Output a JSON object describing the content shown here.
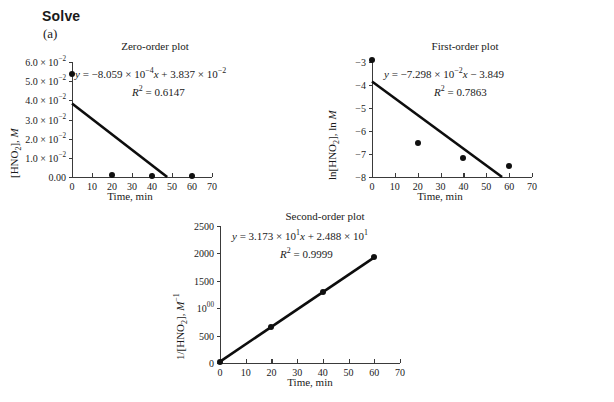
{
  "heading": "Solve",
  "part_label": "(a)",
  "chart_data": [
    {
      "id": "zero-order",
      "type": "scatter",
      "title": "Zero-order plot",
      "xlabel": "Time, min",
      "ylabel": "[HNO2], M",
      "equation": "y = −8.059 × 10−4x + 3.837 × 10−2",
      "r2_label": "R2 = 0.6147",
      "r2_value": 0.6147,
      "slope": -0.0008059,
      "intercept": 0.03837,
      "xlim": [
        0,
        70
      ],
      "ylim": [
        0,
        0.06
      ],
      "xticks": [
        0,
        10,
        20,
        30,
        40,
        50,
        60,
        70
      ],
      "yticks": [
        0,
        0.01,
        0.02,
        0.03,
        0.04,
        0.05,
        0.06
      ],
      "ytick_labels": [
        "0.00",
        "1.0 × 10−2",
        "2.0 × 10−2",
        "3.0 × 10−2",
        "4.0 × 10−2",
        "5.0 × 10−2",
        "6.0 × 10−2"
      ],
      "x": [
        0,
        20,
        40,
        60
      ],
      "y": [
        0.054,
        0.0008,
        0.0006,
        0.0005
      ],
      "fit_x": [
        0,
        47.6
      ],
      "fit_y": [
        0.03837,
        0.0
      ],
      "grid": false,
      "legend": "none"
    },
    {
      "id": "first-order",
      "type": "scatter",
      "title": "First-order plot",
      "xlabel": "Time, min",
      "ylabel": "ln[HNO2], ln M",
      "equation": "y = −7.298 × 10−2x − 3.849",
      "r2_label": "R2 = 0.7863",
      "r2_value": 0.7863,
      "slope": -0.07298,
      "intercept": -3.849,
      "xlim": [
        0,
        70
      ],
      "ylim": [
        -8,
        -3
      ],
      "xticks": [
        0,
        10,
        20,
        30,
        40,
        50,
        60,
        70
      ],
      "yticks": [
        -8,
        -7,
        -6,
        -5,
        -4,
        -3
      ],
      "ytick_labels": [
        "−8",
        "−7",
        "−6",
        "−5",
        "−4",
        "−3"
      ],
      "x": [
        0,
        20,
        40,
        60
      ],
      "y": [
        -2.92,
        -6.5,
        -7.17,
        -7.54
      ],
      "fit_x": [
        0,
        56.9
      ],
      "fit_y": [
        -3.849,
        -8.0
      ],
      "grid": false,
      "legend": "none"
    },
    {
      "id": "second-order",
      "type": "scatter",
      "title": "Second-order plot",
      "xlabel": "Time, min",
      "ylabel": "1/[HNO2], M−1",
      "equation": "y = 3.173 × 101x + 2.488 × 101",
      "r2_label": "R2 = 0.9999",
      "r2_value": 0.9999,
      "slope": 31.73,
      "intercept": 24.88,
      "xlim": [
        0,
        70
      ],
      "ylim": [
        0,
        2500
      ],
      "xticks": [
        0,
        10,
        20,
        30,
        40,
        50,
        60,
        70
      ],
      "yticks": [
        0,
        500,
        1000,
        1500,
        2000,
        2500
      ],
      "ytick_labels": [
        "0",
        "500",
        "1000",
        "1500",
        "2000",
        "2500"
      ],
      "x": [
        0,
        20,
        40,
        60
      ],
      "y": [
        25,
        660,
        1295,
        1930
      ],
      "fit_x": [
        0,
        60
      ],
      "fit_y": [
        24.88,
        1928.7
      ],
      "grid": false,
      "legend": "none"
    }
  ]
}
